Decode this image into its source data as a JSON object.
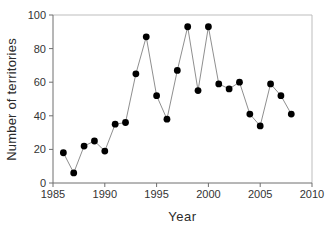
{
  "chart_data": {
    "type": "line",
    "title": "",
    "xlabel": "Year",
    "ylabel": "Number of territories",
    "x": [
      1986,
      1987,
      1988,
      1989,
      1990,
      1991,
      1992,
      1993,
      1994,
      1995,
      1996,
      1997,
      1998,
      1999,
      2000,
      2001,
      2002,
      2003,
      2004,
      2005,
      2006,
      2007,
      2008
    ],
    "values": [
      18,
      6,
      22,
      25,
      19,
      35,
      36,
      65,
      87,
      52,
      38,
      67,
      93,
      55,
      93,
      59,
      56,
      60,
      41,
      34,
      59,
      52,
      41
    ],
    "xlim": [
      1985,
      2010
    ],
    "ylim": [
      0,
      100
    ],
    "xticks": [
      1985,
      1990,
      1995,
      2000,
      2005,
      2010
    ],
    "yticks": [
      0,
      20,
      40,
      60,
      80,
      100
    ],
    "grid": false,
    "legend_position": "none",
    "marker_shape": "circle",
    "marker_color": "#000000",
    "marker_radius": 3.4,
    "line_color": "#8f8f8f",
    "line_width": 1,
    "axis_color": "#6e6e6e",
    "frame_color": "#bdbdbd",
    "tick_label_color": "#333333",
    "background_color": "#ffffff"
  }
}
